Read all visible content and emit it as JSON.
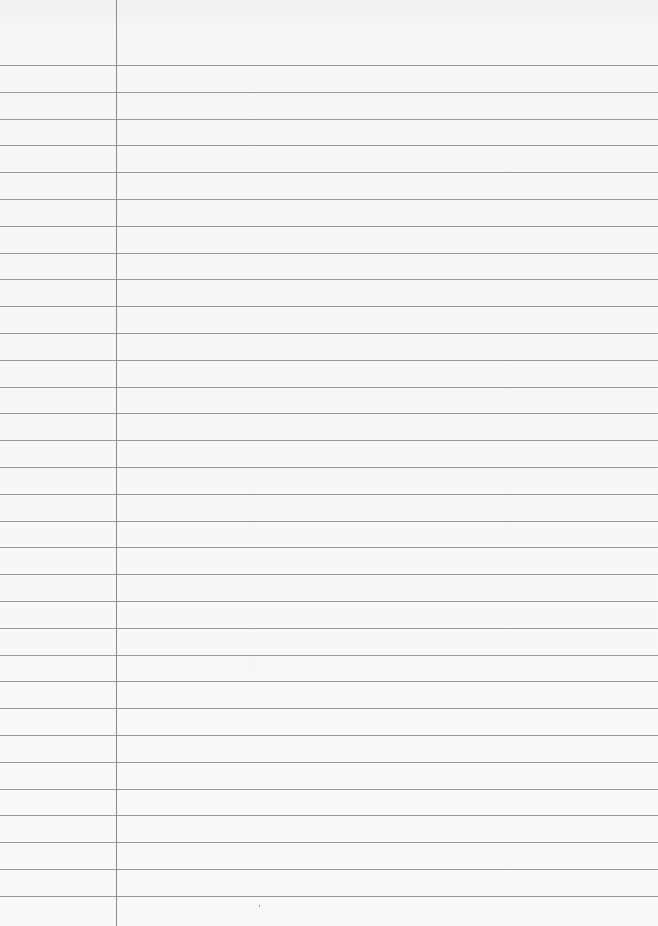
{
  "paper": {
    "type": "lined-paper",
    "background_color": "#f7f7f7",
    "rule_color": "#9a9a9a",
    "margin_color": "#8c8c8c",
    "margin_x": 116,
    "first_rule_y": 65,
    "rule_spacing": 26.8,
    "rule_count": 32
  }
}
